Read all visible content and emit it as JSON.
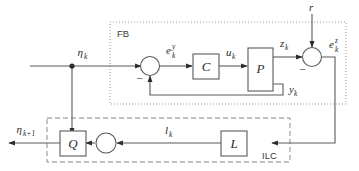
{
  "diagram": {
    "type": "block-diagram",
    "canvas": {
      "width": 359,
      "height": 171
    },
    "colors": {
      "background": "#ffffff",
      "wire": "#5a5a5a",
      "text": "#2b2b2b",
      "group_dotted": "#9a9a9a",
      "group_dashed": "#8a8a8a"
    }
  },
  "groups": {
    "feedback": {
      "label": "FB",
      "style": "dotted"
    },
    "ilc": {
      "label": "ILC",
      "style": "dashed"
    }
  },
  "blocks": {
    "controller": {
      "label": "C",
      "name": "controller-block"
    },
    "plant": {
      "label": "P",
      "name": "plant-block"
    },
    "learning": {
      "label": "L",
      "name": "learning-filter-block"
    },
    "robustness": {
      "label": "Q",
      "name": "q-filter-block"
    }
  },
  "junctions": {
    "inner_sum": {
      "sign_negative": "–",
      "name": "inner-summing-junction"
    },
    "outer_sum": {
      "sign_negative": "–",
      "name": "outer-summing-junction"
    },
    "ilc_sum": {
      "name": "ilc-summing-junction"
    },
    "eta_branch": {
      "name": "eta-branch-node"
    }
  },
  "signals": {
    "eta_k": {
      "base": "η",
      "sub": "k",
      "sup": ""
    },
    "eta_k1": {
      "base": "η",
      "sub": "k+1",
      "sup": ""
    },
    "e_y_k": {
      "base": "e",
      "sub": "k",
      "sup": "y"
    },
    "e_z_k": {
      "base": "e",
      "sub": "k",
      "sup": "z"
    },
    "u_k": {
      "base": "u",
      "sub": "k",
      "sup": ""
    },
    "y_k": {
      "base": "y",
      "sub": "k",
      "sup": ""
    },
    "z_k": {
      "base": "z",
      "sub": "k",
      "sup": ""
    },
    "l_k": {
      "base": "l",
      "sub": "k",
      "sup": ""
    },
    "r": {
      "base": "r",
      "sub": "",
      "sup": ""
    }
  }
}
